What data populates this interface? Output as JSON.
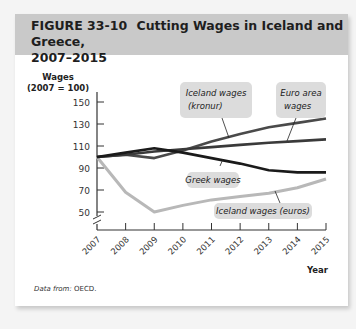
{
  "figure": {
    "label": "FIGURE 33-10",
    "title_line1": "Cutting Wages in Iceland and Greece,",
    "title_line2": "2007–2015"
  },
  "source": {
    "prefix": "Data from:",
    "text": "OECD."
  },
  "chart_data": {
    "type": "line",
    "title": "Cutting Wages in Iceland and Greece, 2007–2015",
    "xlabel": "Year",
    "ylabel": "Wages (2007 = 100)",
    "ylabel_line1": "Wages",
    "ylabel_line2": "(2007 = 100)",
    "x": [
      "2007",
      "2008",
      "2009",
      "2010",
      "2011",
      "2012",
      "2013",
      "2014",
      "2015"
    ],
    "yticks": [
      50,
      70,
      90,
      110,
      130,
      150
    ],
    "ylim": [
      40,
      160
    ],
    "axis_break": true,
    "grid": false,
    "series": [
      {
        "name": "Iceland wages (kronur)",
        "label_line1": "Iceland wages",
        "label_line2": "(kronur)",
        "color": "#4a4a4a",
        "values": [
          100,
          102,
          99,
          106,
          114,
          121,
          127,
          131,
          135
        ]
      },
      {
        "name": "Euro area wages",
        "label_line1": "Euro area",
        "label_line2": "wages",
        "color": "#3a3a3a",
        "values": [
          100,
          102,
          105,
          107,
          109,
          111,
          113,
          114.5,
          116
        ]
      },
      {
        "name": "Greek wages",
        "label_line1": "Greek wages",
        "label_line2": "",
        "color": "#1a1a1a",
        "values": [
          100,
          104,
          108,
          104,
          99,
          94,
          88,
          86,
          86
        ]
      },
      {
        "name": "Iceland wages (euros)",
        "label_line1": "Iceland wages (euros)",
        "label_line2": "",
        "color": "#b8b8b8",
        "values": [
          100,
          68,
          50,
          56,
          61,
          64,
          67,
          72,
          80
        ]
      }
    ]
  }
}
